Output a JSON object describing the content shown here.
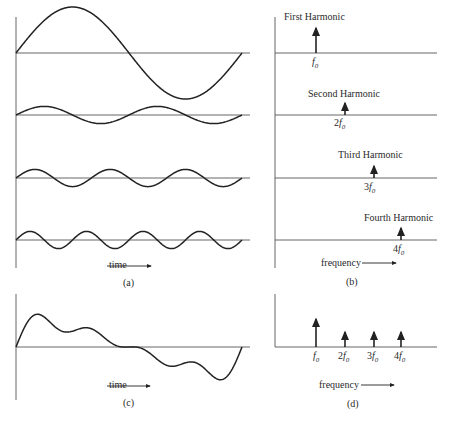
{
  "panels": {
    "a": {
      "caption": "(a)",
      "axis_label": "time",
      "waves": [
        {
          "name": "fundamental",
          "cycles": 1,
          "amplitude": 1.0
        },
        {
          "name": "second",
          "cycles": 2,
          "amplitude": 0.5
        },
        {
          "name": "third",
          "cycles": 3,
          "amplitude": 0.5
        },
        {
          "name": "fourth",
          "cycles": 4,
          "amplitude": 0.5
        }
      ]
    },
    "b": {
      "caption": "(b)",
      "axis_label": "frequency",
      "harmonics": [
        {
          "title": "First Harmonic",
          "coef": "",
          "sym": "f",
          "sub": "0"
        },
        {
          "title": "Second Harmonic",
          "coef": "2",
          "sym": "f",
          "sub": "0"
        },
        {
          "title": "Third Harmonic",
          "coef": "3",
          "sym": "f",
          "sub": "0"
        },
        {
          "title": "Fourth Harmonic",
          "coef": "4",
          "sym": "f",
          "sub": "0"
        }
      ]
    },
    "c": {
      "caption": "(c)",
      "axis_label": "time",
      "description": "Sum of the four harmonic waves"
    },
    "d": {
      "caption": "(d)",
      "axis_label": "frequency",
      "ticks": [
        {
          "coef": "",
          "sym": "f",
          "sub": "0"
        },
        {
          "coef": "2",
          "sym": "f",
          "sub": "0"
        },
        {
          "coef": "3",
          "sym": "f",
          "sub": "0"
        },
        {
          "coef": "4",
          "sym": "f",
          "sub": "0"
        }
      ]
    }
  },
  "chart_data": [
    {
      "type": "line",
      "title": "(a) Time-domain harmonics",
      "xlabel": "time",
      "series": [
        {
          "name": "1st harmonic",
          "cycles": 1,
          "amplitude": 1.0
        },
        {
          "name": "2nd harmonic",
          "cycles": 2,
          "amplitude": 0.5
        },
        {
          "name": "3rd harmonic",
          "cycles": 3,
          "amplitude": 0.5
        },
        {
          "name": "4th harmonic",
          "cycles": 4,
          "amplitude": 0.5
        }
      ]
    },
    {
      "type": "bar",
      "title": "(b) Spectrum of each harmonic",
      "xlabel": "frequency",
      "categories": [
        "f0",
        "2f0",
        "3f0",
        "4f0"
      ],
      "values": [
        1.0,
        0.5,
        0.5,
        0.5
      ]
    },
    {
      "type": "line",
      "title": "(c) Composite waveform",
      "xlabel": "time"
    },
    {
      "type": "bar",
      "title": "(d) Composite spectrum",
      "xlabel": "frequency",
      "categories": [
        "f0",
        "2f0",
        "3f0",
        "4f0"
      ],
      "values": [
        1.0,
        0.5,
        0.5,
        0.5
      ]
    }
  ]
}
